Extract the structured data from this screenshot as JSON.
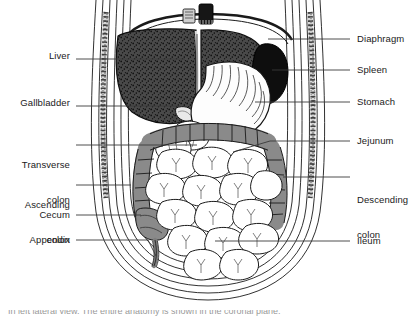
{
  "figure": {
    "caption_partial": "In left lateral view. The entire anatomy is shown in the coronal plane."
  },
  "colors": {
    "liver": "#4a4a4a",
    "spleen": "#111111",
    "colon": "#8a8a8a",
    "small_intestine": "#ffffff",
    "stomach": "#fdfdfd",
    "outline": "#1a1a1a",
    "leader": "#3a3a3a",
    "text": "#1a1a1a"
  },
  "labels": {
    "left": [
      {
        "name": "liver",
        "text": "Liver",
        "lines": [
          "Liver"
        ],
        "x": 70,
        "y": 56,
        "leader_to_x": 185,
        "leader_y": 59
      },
      {
        "name": "gallbladder",
        "text": "Gallbladder",
        "lines": [
          "Gallbladder"
        ],
        "x": 70,
        "y": 103,
        "leader_to_x": 178,
        "leader_y": 106
      },
      {
        "name": "transverse-colon",
        "text": "Transverse colon",
        "lines": [
          "Transverse",
          "colon"
        ],
        "x": 70,
        "y": 142,
        "leader_to_x": 197,
        "leader_y": 145
      },
      {
        "name": "ascending-colon",
        "text": "Ascending colon",
        "lines": [
          "Ascending",
          "colon"
        ],
        "x": 70,
        "y": 182,
        "leader_to_x": 130,
        "leader_y": 185
      },
      {
        "name": "cecum",
        "text": "Cecum",
        "lines": [
          "Cecum"
        ],
        "x": 70,
        "y": 212,
        "leader_to_x": 140,
        "leader_y": 215
      },
      {
        "name": "appendix",
        "text": "Appendix",
        "lines": [
          "Appendix"
        ],
        "x": 70,
        "y": 237,
        "leader_to_x": 160,
        "leader_y": 240
      }
    ],
    "right": [
      {
        "name": "diaphragm",
        "text": "Diaphragm",
        "lines": [
          "Diaphragm"
        ],
        "x": 357,
        "y": 36,
        "leader_from_x": 268,
        "leader_y": 39
      },
      {
        "name": "spleen",
        "text": "Spleen",
        "lines": [
          "Spleen"
        ],
        "x": 357,
        "y": 67,
        "leader_from_x": 272,
        "leader_y": 70
      },
      {
        "name": "stomach",
        "text": "Stomach",
        "lines": [
          "Stomach"
        ],
        "x": 357,
        "y": 99,
        "leader_from_x": 255,
        "leader_y": 102
      },
      {
        "name": "jejunum",
        "text": "Jejunum",
        "lines": [
          "Jejunum"
        ],
        "x": 357,
        "y": 138,
        "leader_from_x": 233,
        "leader_y": 141
      },
      {
        "name": "descending-colon",
        "text": "Descending colon",
        "lines": [
          "Descending",
          "colon"
        ],
        "x": 357,
        "y": 174,
        "leader_from_x": 282,
        "leader_y": 177
      },
      {
        "name": "ileum",
        "text": "Ileum",
        "lines": [
          "Ileum"
        ],
        "x": 357,
        "y": 238,
        "leader_from_x": 215,
        "leader_y": 241
      }
    ]
  },
  "organs": [
    {
      "name": "liver",
      "label": "Liver",
      "shading": "dark-stipple"
    },
    {
      "name": "gallbladder",
      "label": "Gallbladder",
      "shading": "outline"
    },
    {
      "name": "spleen",
      "label": "Spleen",
      "shading": "black"
    },
    {
      "name": "stomach",
      "label": "Stomach",
      "shading": "white-rugae"
    },
    {
      "name": "transverse-colon",
      "label": "Transverse colon",
      "shading": "mid-gray-haustra"
    },
    {
      "name": "ascending-colon",
      "label": "Ascending colon",
      "shading": "mid-gray-haustra"
    },
    {
      "name": "descending-colon",
      "label": "Descending colon",
      "shading": "mid-gray-haustra"
    },
    {
      "name": "cecum",
      "label": "Cecum",
      "shading": "mid-gray"
    },
    {
      "name": "appendix",
      "label": "Appendix",
      "shading": "mid-gray"
    },
    {
      "name": "jejunum",
      "label": "Jejunum",
      "shading": "white-loops"
    },
    {
      "name": "ileum",
      "label": "Ileum",
      "shading": "white-loops"
    },
    {
      "name": "diaphragm",
      "label": "Diaphragm",
      "shading": "line"
    }
  ]
}
